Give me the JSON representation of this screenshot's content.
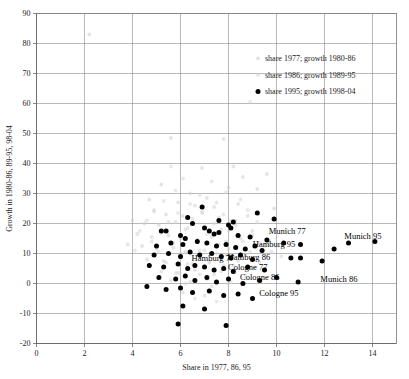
{
  "chart_data": {
    "type": "scatter",
    "title": "",
    "xlabel": "Share in 1977, 86, 95",
    "ylabel": "Growth in 1980-86, 89-95, 98-04",
    "xlim": [
      0,
      15
    ],
    "ylim": [
      -20,
      90
    ],
    "xticks": [
      0,
      2,
      4,
      6,
      8,
      10,
      12,
      14
    ],
    "yticks": [
      -20,
      -10,
      0,
      10,
      20,
      30,
      40,
      50,
      60,
      70,
      80,
      90
    ],
    "xtick_labels": [
      "0",
      "2",
      "4",
      "6",
      "8",
      "10",
      "12",
      "14"
    ],
    "ytick_labels": [
      "-20",
      "-10",
      "0",
      "10",
      "20",
      "30",
      "40",
      "50",
      "60",
      "70",
      "80",
      "90"
    ],
    "grid": true,
    "grid_color": "#8a8a8a",
    "legend_position": "upper-right-inside",
    "series": [
      {
        "name": "share 1977; growth 1980-86",
        "marker": "faint-dot",
        "color": "#cfcfcf",
        "points": [
          [
            2.2,
            83.0
          ],
          [
            5.6,
            48.5
          ],
          [
            7.8,
            48.2
          ],
          [
            8.9,
            60.5
          ],
          [
            6.9,
            38.5
          ],
          [
            8.2,
            39.0
          ],
          [
            8.6,
            35.5
          ],
          [
            9.6,
            36.5
          ],
          [
            9.2,
            31.5
          ],
          [
            8.0,
            32.0
          ],
          [
            6.4,
            30.0
          ],
          [
            7.1,
            28.5
          ],
          [
            5.9,
            27.0
          ],
          [
            6.6,
            26.0
          ],
          [
            7.4,
            25.5
          ],
          [
            8.4,
            26.5
          ],
          [
            4.9,
            24.0
          ],
          [
            5.4,
            23.0
          ],
          [
            6.1,
            22.5
          ],
          [
            6.9,
            23.5
          ],
          [
            7.6,
            22.0
          ],
          [
            8.1,
            21.0
          ],
          [
            8.8,
            22.5
          ],
          [
            4.5,
            20.0
          ],
          [
            5.1,
            19.5
          ],
          [
            5.8,
            20.5
          ],
          [
            6.3,
            18.5
          ],
          [
            7.0,
            19.0
          ],
          [
            7.7,
            18.0
          ],
          [
            8.3,
            19.5
          ],
          [
            9.0,
            17.5
          ],
          [
            4.2,
            16.5
          ],
          [
            4.8,
            15.5
          ],
          [
            5.5,
            16.0
          ],
          [
            6.0,
            15.0
          ],
          [
            6.7,
            14.5
          ],
          [
            7.3,
            15.5
          ],
          [
            7.9,
            14.0
          ],
          [
            8.5,
            15.0
          ],
          [
            9.3,
            13.5
          ],
          [
            4.4,
            12.5
          ],
          [
            5.0,
            11.5
          ],
          [
            5.7,
            12.0
          ],
          [
            6.2,
            10.5
          ],
          [
            6.8,
            11.0
          ],
          [
            7.5,
            10.0
          ],
          [
            8.0,
            11.5
          ],
          [
            8.7,
            9.5
          ],
          [
            9.8,
            10.5
          ],
          [
            4.6,
            8.0
          ],
          [
            5.3,
            7.5
          ],
          [
            6.0,
            8.5
          ],
          [
            6.5,
            6.5
          ],
          [
            7.2,
            7.0
          ],
          [
            7.8,
            6.0
          ],
          [
            8.4,
            7.5
          ],
          [
            9.1,
            5.5
          ],
          [
            5.2,
            4.0
          ],
          [
            5.9,
            3.5
          ],
          [
            6.6,
            4.5
          ],
          [
            7.4,
            3.0
          ],
          [
            8.2,
            4.0
          ],
          [
            5.6,
            1.0
          ],
          [
            6.4,
            0.5
          ],
          [
            7.1,
            1.5
          ],
          [
            8.0,
            0.0
          ],
          [
            6.1,
            -3.0
          ],
          [
            7.0,
            -4.0
          ],
          [
            4.7,
            28.0
          ],
          [
            5.2,
            33.0
          ],
          [
            9.9,
            25.0
          ],
          [
            10.4,
            18.0
          ],
          [
            4.0,
            21.0
          ],
          [
            3.8,
            13.0
          ]
        ]
      },
      {
        "name": "share 1986; growth 1989-95",
        "marker": "faint-dot",
        "color": "#d6d6d6",
        "points": [
          [
            6.1,
            35.0
          ],
          [
            7.3,
            34.0
          ],
          [
            5.8,
            31.0
          ],
          [
            6.8,
            29.5
          ],
          [
            7.9,
            30.5
          ],
          [
            5.3,
            27.5
          ],
          [
            6.4,
            26.5
          ],
          [
            7.5,
            27.0
          ],
          [
            8.5,
            28.0
          ],
          [
            4.9,
            24.5
          ],
          [
            5.9,
            23.5
          ],
          [
            6.9,
            24.0
          ],
          [
            7.8,
            23.0
          ],
          [
            8.8,
            24.5
          ],
          [
            4.6,
            21.0
          ],
          [
            5.5,
            20.5
          ],
          [
            6.5,
            21.5
          ],
          [
            7.4,
            20.0
          ],
          [
            8.3,
            21.0
          ],
          [
            9.2,
            20.5
          ],
          [
            4.3,
            17.5
          ],
          [
            5.2,
            17.0
          ],
          [
            6.2,
            18.0
          ],
          [
            7.1,
            16.5
          ],
          [
            8.0,
            17.5
          ],
          [
            9.0,
            16.0
          ],
          [
            4.8,
            14.0
          ],
          [
            5.7,
            13.5
          ],
          [
            6.7,
            14.5
          ],
          [
            7.6,
            13.0
          ],
          [
            8.6,
            14.0
          ],
          [
            9.5,
            12.5
          ],
          [
            5.1,
            10.5
          ],
          [
            6.0,
            10.0
          ],
          [
            7.0,
            11.0
          ],
          [
            7.9,
            9.5
          ],
          [
            8.9,
            10.5
          ],
          [
            5.4,
            7.0
          ],
          [
            6.3,
            6.5
          ],
          [
            7.2,
            7.5
          ],
          [
            8.2,
            6.0
          ],
          [
            9.3,
            7.0
          ],
          [
            5.8,
            3.5
          ],
          [
            6.8,
            3.0
          ],
          [
            7.7,
            4.0
          ],
          [
            8.7,
            2.5
          ],
          [
            6.2,
            0.0
          ],
          [
            7.3,
            -1.0
          ],
          [
            8.1,
            0.5
          ],
          [
            6.6,
            -5.0
          ],
          [
            7.5,
            -6.0
          ],
          [
            5.6,
            39.0
          ],
          [
            9.7,
            14.0
          ],
          [
            10.2,
            9.0
          ],
          [
            4.1,
            11.0
          ]
        ]
      },
      {
        "name": "share 1995; growth 1998-04",
        "marker": "solid-dot",
        "color": "#000000",
        "points": [
          [
            6.3,
            22.0
          ],
          [
            6.9,
            25.5
          ],
          [
            7.6,
            21.0
          ],
          [
            8.2,
            20.5
          ],
          [
            9.2,
            23.5
          ],
          [
            9.9,
            21.5
          ],
          [
            5.2,
            17.5
          ],
          [
            5.4,
            17.5
          ],
          [
            6.5,
            20.0
          ],
          [
            6.0,
            16.0
          ],
          [
            6.2,
            15.0
          ],
          [
            7.0,
            18.5
          ],
          [
            7.2,
            17.5
          ],
          [
            7.4,
            16.5
          ],
          [
            7.6,
            17.0
          ],
          [
            8.0,
            19.5
          ],
          [
            8.1,
            18.5
          ],
          [
            8.4,
            16.0
          ],
          [
            8.9,
            15.5
          ],
          [
            9.6,
            14.5
          ],
          [
            10.3,
            13.5
          ],
          [
            11.0,
            13.0
          ],
          [
            13.0,
            13.5
          ],
          [
            14.1,
            14.0
          ],
          [
            5.0,
            12.5
          ],
          [
            5.6,
            13.5
          ],
          [
            6.1,
            13.0
          ],
          [
            6.7,
            14.0
          ],
          [
            7.1,
            13.5
          ],
          [
            7.5,
            12.5
          ],
          [
            7.9,
            13.0
          ],
          [
            8.3,
            12.0
          ],
          [
            8.7,
            11.5
          ],
          [
            9.1,
            12.5
          ],
          [
            9.4,
            11.0
          ],
          [
            12.4,
            11.5
          ],
          [
            4.9,
            9.5
          ],
          [
            5.5,
            10.0
          ],
          [
            6.0,
            9.0
          ],
          [
            6.4,
            10.5
          ],
          [
            6.8,
            9.5
          ],
          [
            7.3,
            10.0
          ],
          [
            7.7,
            9.0
          ],
          [
            8.1,
            8.5
          ],
          [
            8.5,
            9.5
          ],
          [
            9.0,
            8.0
          ],
          [
            10.6,
            8.5
          ],
          [
            11.0,
            8.5
          ],
          [
            11.9,
            7.5
          ],
          [
            4.7,
            6.0
          ],
          [
            5.3,
            5.5
          ],
          [
            5.9,
            6.5
          ],
          [
            6.3,
            5.0
          ],
          [
            6.6,
            6.0
          ],
          [
            7.0,
            5.5
          ],
          [
            7.4,
            4.5
          ],
          [
            7.8,
            5.0
          ],
          [
            8.2,
            4.0
          ],
          [
            8.8,
            5.5
          ],
          [
            9.5,
            4.5
          ],
          [
            5.1,
            2.0
          ],
          [
            5.8,
            1.5
          ],
          [
            6.2,
            2.5
          ],
          [
            6.6,
            1.0
          ],
          [
            7.1,
            2.0
          ],
          [
            7.5,
            0.5
          ],
          [
            8.0,
            1.5
          ],
          [
            8.6,
            0.0
          ],
          [
            9.3,
            1.0
          ],
          [
            10.0,
            2.0
          ],
          [
            10.9,
            0.5
          ],
          [
            4.6,
            -1.0
          ],
          [
            5.4,
            -2.0
          ],
          [
            6.0,
            -1.5
          ],
          [
            6.5,
            -3.0
          ],
          [
            7.2,
            -2.5
          ],
          [
            7.8,
            -4.0
          ],
          [
            8.4,
            -3.5
          ],
          [
            9.0,
            -5.0
          ],
          [
            6.1,
            -7.5
          ],
          [
            7.0,
            -8.5
          ],
          [
            5.9,
            -13.5
          ],
          [
            7.9,
            -14.0
          ]
        ]
      }
    ],
    "annotations": [
      {
        "text": "Munich 77",
        "x": 10.45,
        "y": 16.4
      },
      {
        "text": "Munich 95",
        "x": 13.6,
        "y": 15.0
      },
      {
        "text": "Hamburg 95",
        "x": 9.9,
        "y": 12.2
      },
      {
        "text": "Hamburg 77",
        "x": 7.35,
        "y": 7.6
      },
      {
        "text": "Hamburg 86",
        "x": 8.85,
        "y": 7.8
      },
      {
        "text": "Cologne 77",
        "x": 8.8,
        "y": 4.6
      },
      {
        "text": "Cologne 86",
        "x": 9.3,
        "y": 1.2
      },
      {
        "text": "Munich 86",
        "x": 12.6,
        "y": 0.4
      },
      {
        "text": "Cologne 95",
        "x": 10.1,
        "y": -4.3
      }
    ]
  },
  "axes": {
    "x_title": "Share in 1977, 86, 95",
    "y_title": "Growth in 1980-86, 89-95, 98-04"
  },
  "legend": {
    "entries": [
      {
        "label": "share 1977; growth 1980-86",
        "marker": "faint-dot"
      },
      {
        "label": "share 1986; growth 1989-95",
        "marker": "faint-dot"
      },
      {
        "label": "share 1995; growth 1998-04",
        "marker": "solid-dot"
      }
    ]
  }
}
